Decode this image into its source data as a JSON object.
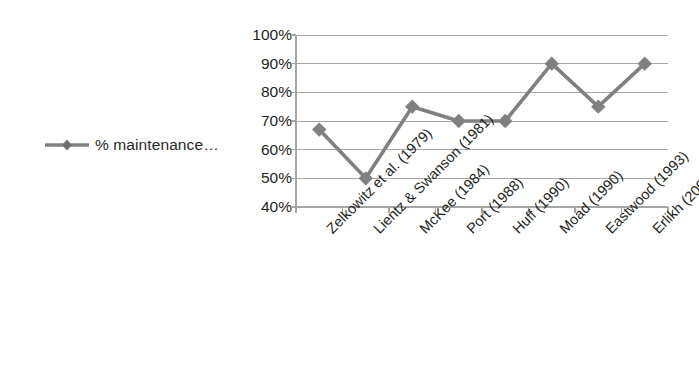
{
  "chart_data": {
    "type": "line",
    "title": "",
    "xlabel": "",
    "ylabel": "",
    "ylim": [
      40,
      100
    ],
    "ytick_labels": [
      "100%",
      "90%",
      "80%",
      "70%",
      "60%",
      "50%",
      "40%"
    ],
    "ytick_values": [
      100,
      90,
      80,
      70,
      60,
      50,
      40
    ],
    "grid": true,
    "legend_position": "left",
    "categories": [
      "Zelkowitz et al. (1979)",
      "Lientz & Swanson (1981)",
      "McKee (1984)",
      "Port (1988)",
      "Huff (1990)",
      "Moad (1990)",
      "Eastwood (1993)",
      "Erlikh (2000)"
    ],
    "series": [
      {
        "name": "% maintenance…",
        "values": [
          67,
          50,
          75,
          70,
          70,
          90,
          75,
          90
        ],
        "color": "#808080",
        "marker": "diamond"
      }
    ]
  },
  "legend": {
    "label": "% maintenance…",
    "marker_name": "line-diamond-marker"
  },
  "colors": {
    "series": "#808080",
    "grid": "#a6a6a6",
    "axis": "#a6a6a6",
    "text": "#1d1f21",
    "background": "#ffffff"
  }
}
